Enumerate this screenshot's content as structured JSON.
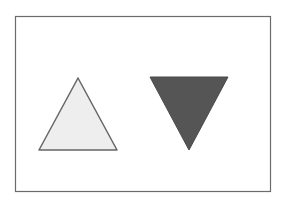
{
  "figure": {
    "frame": {
      "x": 15.5,
      "y": 16.5,
      "width": 255,
      "height": 175,
      "stroke": "#6b6b6b"
    },
    "shapes": [
      {
        "name": "upward-triangle",
        "points": "78,78 39,150 117,150",
        "fill": "#eeeeee",
        "stroke": "#666666"
      },
      {
        "name": "downward-triangle",
        "points": "150,77 228,77 189,150",
        "fill": "#555555",
        "stroke": "#4a4a4a"
      }
    ]
  }
}
